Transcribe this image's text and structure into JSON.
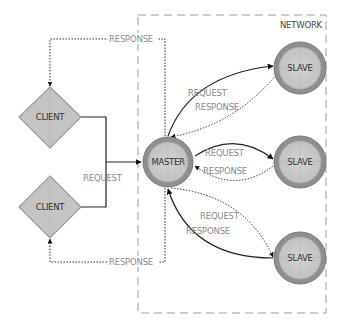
{
  "network": {
    "label": "NETWORK"
  },
  "master": {
    "label": "MASTER"
  },
  "slaves": [
    {
      "label": "SLAVE"
    },
    {
      "label": "SLAVE"
    },
    {
      "label": "SLAVE"
    }
  ],
  "clients": [
    {
      "label": "CLIENT"
    },
    {
      "label": "CLIENT"
    }
  ],
  "edges": {
    "client_top_response": "RESPONSE",
    "client_bottom_response": "RESPONSE",
    "clients_request": "REQUEST",
    "slave1_request": "REQUEST",
    "slave1_response": "RESPONSE",
    "slave2_request": "REQUEST",
    "slave2_response": "RESPONSE",
    "slave3_request": "REQUEST",
    "slave3_response": "RESPONSE"
  },
  "colors": {
    "node_ring": "#8f8f8f",
    "node_fill": "#c9c9c9",
    "diamond_fill": "#c4c4c4",
    "diamond_border": "#9a9a9a",
    "line": "#222222",
    "label": "#8a8a8a",
    "network_border": "#9a9a9a"
  }
}
